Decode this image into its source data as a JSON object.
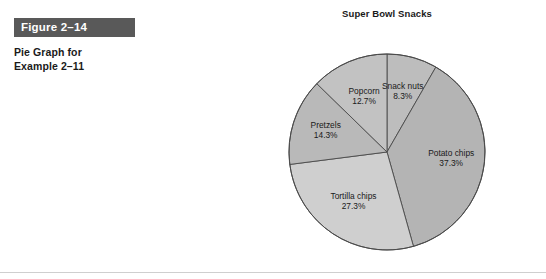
{
  "figure": {
    "banner_label": "Figure 2–14",
    "caption_line1": "Pie Graph for",
    "caption_line2": "Example 2–11",
    "banner_color": "#595959"
  },
  "chart_data": {
    "type": "pie",
    "title": "Super Bowl Snacks",
    "xlabel": "",
    "ylabel": "",
    "legend_position": "none",
    "labels_inside": true,
    "start_angle_deg": 0,
    "direction": "clockwise",
    "categories": [
      "Snack nuts",
      "Potato chips",
      "Tortilla chips",
      "Pretzels",
      "Popcorn"
    ],
    "values": [
      8.3,
      37.3,
      27.3,
      14.3,
      12.7
    ],
    "value_unit": "%",
    "slices": [
      {
        "label": "Snack nuts",
        "pct_text": "8.3%",
        "value": 8.3,
        "color": "#bdbdbd"
      },
      {
        "label": "Potato chips",
        "pct_text": "37.3%",
        "value": 37.3,
        "color": "#b4b4b4"
      },
      {
        "label": "Tortilla chips",
        "pct_text": "27.3%",
        "value": 27.3,
        "color": "#cfcfcf"
      },
      {
        "label": "Pretzels",
        "pct_text": "14.3%",
        "value": 14.3,
        "color": "#b9b9b9"
      },
      {
        "label": "Popcorn",
        "pct_text": "12.7%",
        "value": 12.7,
        "color": "#c2c2c2"
      }
    ]
  }
}
